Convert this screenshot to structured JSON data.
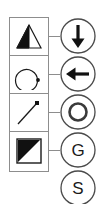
{
  "diagram": {
    "symbol_cells": [
      {
        "id": "cell-triangle-half-filled",
        "icon": "triangle-left-half-filled-icon",
        "label": "Triangle, left half filled"
      },
      {
        "id": "cell-rotation-arc",
        "icon": "rotation-arc-with-dot-icon",
        "label": "Open circular arc with end dot"
      },
      {
        "id": "cell-line-with-endpoint",
        "icon": "diagonal-line-with-square-endpoint-icon",
        "label": "Diagonal line with square endpoint"
      },
      {
        "id": "cell-square-half-filled",
        "icon": "square-upper-left-triangle-filled-icon",
        "label": "Square, upper-left triangle filled"
      }
    ],
    "badges": [
      {
        "id": "badge-down-arrow",
        "icon": "arrow-down-icon",
        "text": "",
        "label": "Down arrow in circle"
      },
      {
        "id": "badge-left-arrow",
        "icon": "arrow-left-icon",
        "text": "",
        "label": "Left arrow in circle"
      },
      {
        "id": "badge-ring",
        "icon": "ring-circle-icon",
        "text": "",
        "label": "Ring inside circle"
      },
      {
        "id": "badge-letter-g",
        "icon": "letter-badge-icon",
        "text": "G",
        "label": "Letter G in circle"
      },
      {
        "id": "badge-letter-s",
        "icon": "letter-badge-icon",
        "text": "S",
        "label": "Letter S in circle"
      }
    ],
    "connectors": [
      {
        "id": "connector-0"
      },
      {
        "id": "connector-1"
      },
      {
        "id": "connector-2"
      },
      {
        "id": "connector-3"
      }
    ],
    "colors": {
      "stroke": "#8d8d8d",
      "glyph": "#1a1a1a",
      "fill": "#111111",
      "background": "#ffffff"
    }
  }
}
